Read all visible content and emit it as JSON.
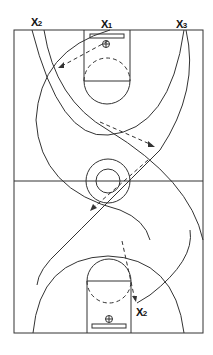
{
  "diagram": {
    "type": "basketball-drill",
    "players": [
      {
        "id": "x2_top",
        "letter": "X",
        "number": "2"
      },
      {
        "id": "x1_top",
        "letter": "X",
        "number": "1"
      },
      {
        "id": "x3_top",
        "letter": "X",
        "number": "3"
      },
      {
        "id": "x2_bottom",
        "letter": "X",
        "number": "2"
      }
    ],
    "colors": {
      "line": "#333333",
      "background": "#ffffff",
      "text": "#111111"
    }
  }
}
